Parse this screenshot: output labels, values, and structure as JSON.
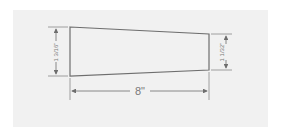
{
  "diagram": {
    "shape": "tapered trapezoid",
    "dimensions": {
      "left_height": "1 3/16\"",
      "right_height": "1 1/32\"",
      "length": "8\""
    },
    "colors": {
      "background": "#f1f1f1",
      "line": "#6e6e6e",
      "text": "#7a7a7a"
    }
  }
}
